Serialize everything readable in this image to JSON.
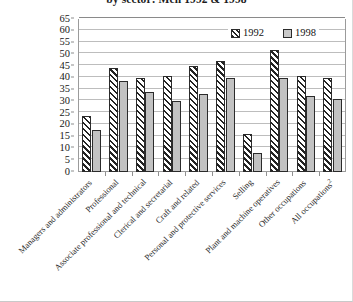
{
  "chart_data": {
    "type": "bar",
    "title": "by sector: Men 1992 & 1998",
    "xlabel": "",
    "ylabel": "",
    "ylim": [
      0,
      65
    ],
    "ytick_step": 5,
    "yticks": [
      0,
      5,
      10,
      15,
      20,
      25,
      30,
      35,
      40,
      45,
      50,
      55,
      60,
      65
    ],
    "grid": true,
    "legend_position": "top-right",
    "categories": [
      "Managers and administrators",
      "Professional",
      "Associate professional and technical",
      "Clerical and secretarial",
      "Craft and related",
      "Personal and protective services",
      "Selling",
      "Plant and machine operatives",
      "Other occupations",
      "All occupations2"
    ],
    "series": [
      {
        "name": "1992",
        "color": "#ffffff",
        "pattern": "diagonal-hatch",
        "values": [
          24,
          44,
          40,
          41,
          45,
          47,
          16,
          52,
          41,
          40
        ]
      },
      {
        "name": "1998",
        "color": "#c2c2c2",
        "pattern": "solid",
        "values": [
          18,
          38.5,
          34,
          30,
          33,
          40,
          8,
          40,
          32.5,
          31
        ]
      }
    ]
  },
  "legend": {
    "entries": [
      {
        "label": "1992"
      },
      {
        "label": "1998"
      }
    ]
  },
  "footnote_marker": "2"
}
